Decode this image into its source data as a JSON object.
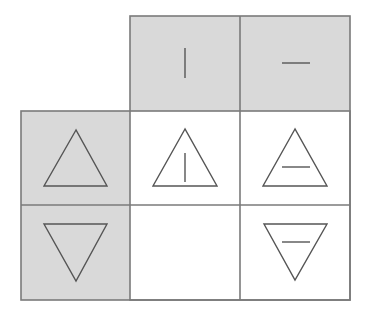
{
  "puzzle": {
    "type": "logic-grid-matrix",
    "colors": {
      "header_fill": "#d9d9d9",
      "cell_fill": "#ffffff",
      "grid_line": "#7a7a7a",
      "symbol_stroke": "#555555"
    },
    "column_headers": [
      {
        "symbol": "vertical-line"
      },
      {
        "symbol": "horizontal-line"
      }
    ],
    "row_headers": [
      {
        "symbol": "triangle-up"
      },
      {
        "symbol": "triangle-down"
      }
    ],
    "cells": [
      [
        {
          "symbol": "triangle-up-with-vertical-line"
        },
        {
          "symbol": "triangle-up-with-horizontal-line"
        }
      ],
      [
        {
          "symbol": "empty"
        },
        {
          "symbol": "triangle-down-with-horizontal-line"
        }
      ]
    ],
    "missing_cell": {
      "row": 2,
      "col": 1
    }
  }
}
